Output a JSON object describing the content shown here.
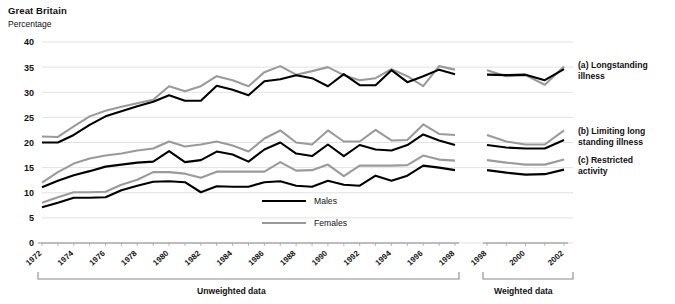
{
  "header": {
    "country": "Great Britain",
    "units": "Percentage"
  },
  "legend": {
    "males": "Males",
    "females": "Females"
  },
  "series_labels": {
    "a_line1": "(a) Longstanding",
    "a_line2": "illness",
    "b_line1": "(b) Limiting long",
    "b_line2": "standing illness",
    "c_line1": "(c) Restricted",
    "c_line2": "activity"
  },
  "footer": {
    "unweighted": "Unweighted data",
    "weighted": "Weighted data"
  },
  "colors": {
    "males": "#000000",
    "females": "#9a9a9a",
    "grid": "#d6d6d6",
    "axis": "#8a8a8a",
    "background": "#ffffff"
  },
  "chart_data": {
    "type": "line",
    "title": "Great Britain",
    "xlabel": "",
    "ylabel": "Percentage",
    "ylim": [
      0,
      40
    ],
    "yticks": [
      0,
      5,
      10,
      15,
      20,
      25,
      30,
      35,
      40
    ],
    "grid": true,
    "legend_position": "inside-bottom-center",
    "panels": [
      {
        "name": "Unweighted data",
        "x": [
          1972,
          1973,
          1974,
          1975,
          1976,
          1977,
          1978,
          1979,
          1980,
          1981,
          1982,
          1983,
          1984,
          1985,
          1986,
          1987,
          1988,
          1989,
          1990,
          1991,
          1992,
          1993,
          1994,
          1995,
          1996,
          1997,
          1998
        ],
        "xticks": [
          1972,
          1974,
          1976,
          1978,
          1980,
          1982,
          1984,
          1986,
          1988,
          1990,
          1992,
          1994,
          1996,
          1998
        ],
        "series": [
          {
            "name": "(a) Longstanding illness - Males",
            "group": "a",
            "sex": "Males",
            "color": "#000000",
            "values": [
              20.0,
              20.0,
              21.5,
              23.5,
              25.2,
              26.2,
              27.2,
              28.1,
              29.4,
              28.3,
              28.3,
              31.3,
              30.5,
              29.4,
              32.2,
              32.6,
              33.4,
              32.8,
              31.2,
              33.6,
              31.4,
              31.4,
              34.4,
              32.0,
              33.2,
              34.5,
              33.6
            ]
          },
          {
            "name": "(a) Longstanding illness - Females",
            "group": "a",
            "sex": "Females",
            "color": "#9a9a9a",
            "values": [
              21.2,
              21.1,
              23.2,
              25.2,
              26.3,
              27.1,
              27.8,
              28.5,
              31.2,
              30.2,
              31.2,
              33.2,
              32.4,
              31.2,
              34.0,
              35.2,
              33.5,
              34.2,
              35.0,
              33.4,
              32.4,
              32.8,
              34.6,
              33.2,
              31.2,
              35.2,
              34.5
            ]
          },
          {
            "name": "(b) Limiting longstanding illness - Males",
            "group": "b",
            "sex": "Males",
            "color": "#000000",
            "values": [
              11.1,
              12.4,
              13.5,
              14.3,
              15.2,
              15.6,
              16.0,
              16.2,
              18.3,
              16.1,
              16.5,
              18.2,
              17.6,
              16.2,
              18.6,
              20.0,
              17.8,
              17.3,
              19.6,
              17.3,
              19.5,
              18.6,
              18.4,
              19.5,
              21.6,
              20.4,
              19.5
            ]
          },
          {
            "name": "(b) Limiting longstanding illness - Females",
            "group": "b",
            "sex": "Females",
            "color": "#9a9a9a",
            "values": [
              12.0,
              14.1,
              15.8,
              16.8,
              17.4,
              17.8,
              18.4,
              18.8,
              20.2,
              19.2,
              19.6,
              20.2,
              19.4,
              18.2,
              20.8,
              22.4,
              20.0,
              19.6,
              22.4,
              20.2,
              20.2,
              22.5,
              20.4,
              20.5,
              23.6,
              21.7,
              21.5
            ]
          },
          {
            "name": "(c) Restricted activity - Males",
            "group": "c",
            "sex": "Males",
            "color": "#000000",
            "values": [
              7.1,
              8.0,
              9.0,
              9.0,
              9.1,
              10.5,
              11.4,
              12.2,
              12.3,
              12.1,
              10.1,
              11.3,
              11.2,
              11.2,
              12.1,
              12.3,
              11.4,
              11.2,
              12.4,
              11.6,
              11.4,
              13.4,
              12.4,
              13.4,
              15.4,
              15.0,
              14.5
            ]
          },
          {
            "name": "(c) Restricted activity - Females",
            "group": "c",
            "sex": "Females",
            "color": "#9a9a9a",
            "values": [
              8.0,
              9.1,
              10.1,
              10.1,
              10.2,
              11.6,
              12.6,
              14.1,
              14.1,
              13.8,
              13.0,
              14.2,
              14.2,
              14.2,
              14.2,
              16.1,
              14.4,
              14.5,
              15.6,
              13.3,
              15.4,
              15.4,
              15.4,
              15.5,
              17.4,
              16.6,
              16.4
            ]
          }
        ]
      },
      {
        "name": "Weighted data",
        "x": [
          1998,
          1999,
          2000,
          2001,
          2002
        ],
        "xticks": [
          1998,
          2000,
          2002
        ],
        "series": [
          {
            "name": "(a) Longstanding illness - Males",
            "group": "a",
            "sex": "Males",
            "color": "#000000",
            "values": [
              33.5,
              33.4,
              33.5,
              32.4,
              34.6
            ]
          },
          {
            "name": "(a) Longstanding illness - Females",
            "group": "a",
            "sex": "Females",
            "color": "#9a9a9a",
            "values": [
              34.4,
              33.2,
              33.4,
              31.5,
              35.1
            ]
          },
          {
            "name": "(b) Limiting longstanding illness - Males",
            "group": "b",
            "sex": "Males",
            "color": "#000000",
            "values": [
              19.5,
              19.0,
              18.8,
              18.8,
              20.5
            ]
          },
          {
            "name": "(b) Limiting longstanding illness - Females",
            "group": "b",
            "sex": "Females",
            "color": "#9a9a9a",
            "values": [
              21.5,
              20.2,
              19.6,
              19.6,
              22.4
            ]
          },
          {
            "name": "(c) Restricted activity - Males",
            "group": "c",
            "sex": "Males",
            "color": "#000000",
            "values": [
              14.5,
              14.0,
              13.6,
              13.7,
              14.6
            ]
          },
          {
            "name": "(c) Restricted activity - Females",
            "group": "c",
            "sex": "Females",
            "color": "#9a9a9a",
            "values": [
              16.5,
              16.0,
              15.6,
              15.6,
              16.6
            ]
          }
        ]
      }
    ]
  }
}
